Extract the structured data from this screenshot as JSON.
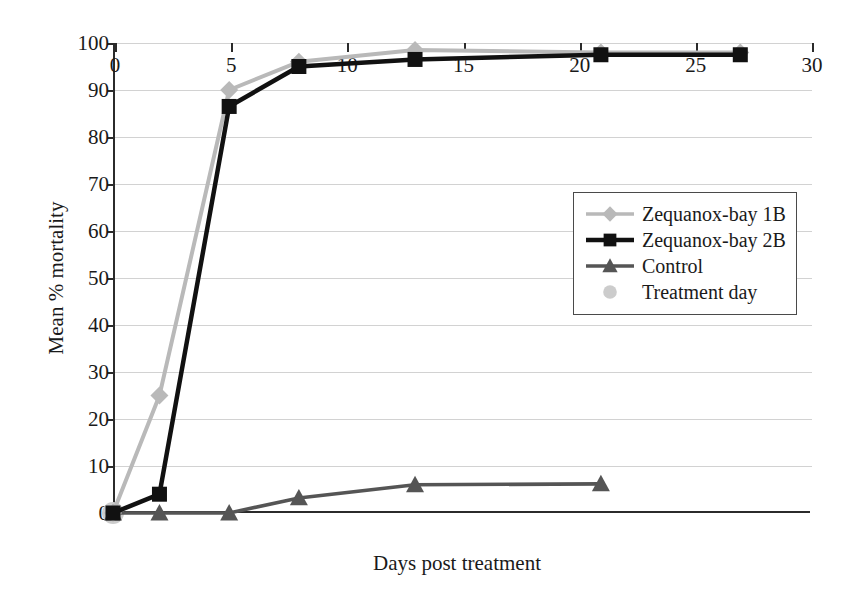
{
  "chart_data": {
    "type": "line",
    "title": "",
    "xlabel": "Days post treatment",
    "ylabel": "Mean % mortality",
    "xlim": [
      0,
      30
    ],
    "ylim": [
      0,
      100
    ],
    "xticks": [
      0,
      5,
      10,
      15,
      20,
      25,
      30
    ],
    "yticks": [
      0,
      10,
      20,
      30,
      40,
      50,
      60,
      70,
      80,
      90,
      100
    ],
    "grid": "horizontal",
    "legend_position": "center-right",
    "series": [
      {
        "name": "Zequanox-bay 1B",
        "marker": "diamond",
        "color": "#b9b9b9",
        "x": [
          0,
          2,
          5,
          8,
          13,
          21,
          27
        ],
        "y": [
          0,
          25,
          90,
          96,
          98.5,
          98,
          98
        ]
      },
      {
        "name": "Zequanox-bay 2B",
        "marker": "square",
        "color": "#111111",
        "x": [
          0,
          2,
          5,
          8,
          13,
          21,
          27
        ],
        "y": [
          0,
          4,
          86.5,
          95,
          96.5,
          97.5,
          97.5
        ]
      },
      {
        "name": "Control",
        "marker": "triangle",
        "color": "#555555",
        "x": [
          0,
          2,
          5,
          8,
          13,
          21
        ],
        "y": [
          0,
          0,
          0,
          3.2,
          6,
          6.2
        ]
      },
      {
        "name": "Treatment day",
        "marker": "circle",
        "color": "#cccccc",
        "x": [
          0
        ],
        "y": [
          0
        ]
      }
    ]
  },
  "legend": {
    "items": [
      {
        "label": "Zequanox-bay 1B",
        "marker": "diamond-marker",
        "color": "#b9b9b9",
        "line": true
      },
      {
        "label": "Zequanox-bay 2B",
        "marker": "square-marker",
        "color": "#111111",
        "line": true
      },
      {
        "label": "Control",
        "marker": "triangle-marker",
        "color": "#555555",
        "line": true
      },
      {
        "label": "Treatment day",
        "marker": "circle-marker",
        "color": "#cccccc",
        "line": false
      }
    ]
  },
  "axes": {
    "x_title": "Days post treatment",
    "y_title": "Mean % mortality",
    "x_tick_labels": [
      "0",
      "5",
      "10",
      "15",
      "20",
      "25",
      "30"
    ],
    "y_tick_labels": [
      "0",
      "10",
      "20",
      "30",
      "40",
      "50",
      "60",
      "70",
      "80",
      "90",
      "100"
    ]
  }
}
